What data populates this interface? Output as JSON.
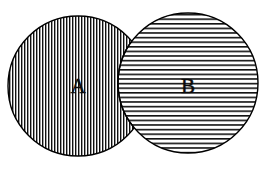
{
  "figure": {
    "width": 263,
    "height": 169,
    "background_color": "#ffffff",
    "ink_color": "#000000"
  },
  "chart_data": {
    "type": "diagram",
    "subtype": "venn-2-set",
    "title": "",
    "sets": [
      {
        "id": "A",
        "label": "A",
        "fill_pattern": "vertical-hatch",
        "center_x": 78,
        "center_y": 86,
        "radius": 70,
        "label_x": 78,
        "label_y": 88,
        "draw_order": 1
      },
      {
        "id": "B",
        "label": "B",
        "fill_pattern": "horizontal-hatch",
        "center_x": 188,
        "center_y": 83,
        "radius": 70,
        "label_x": 188,
        "label_y": 88,
        "draw_order": 2
      }
    ],
    "intersection": {
      "present": true,
      "label": "",
      "fill_pattern": "horizontal-hatch",
      "top_point_x": 118,
      "top_point_y": 13,
      "bottom_point_x": 126,
      "bottom_point_y": 150
    },
    "patterns": {
      "vertical_hatch_spacing": 3,
      "vertical_hatch_width": 1.4,
      "horizontal_hatch_spacing": 4.6,
      "horizontal_hatch_width": 1.6
    },
    "outline": {
      "stroke_color": "#000000",
      "stroke_width": 1.4
    },
    "legend": {
      "visible": false,
      "position": "none"
    },
    "axes": {
      "visible": false
    },
    "grid": false
  }
}
